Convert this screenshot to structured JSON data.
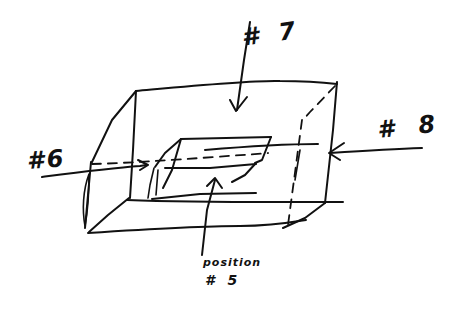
{
  "diagram": {
    "type": "hand-drawn sketch",
    "ink_color": "#111111",
    "background_color": "#ffffff",
    "labels": {
      "top": "# 7",
      "left": "#6",
      "right": "# 8",
      "bottom_line1": "position",
      "bottom_line2": "# 5"
    }
  }
}
